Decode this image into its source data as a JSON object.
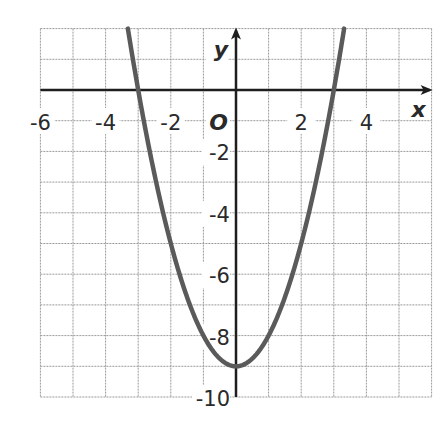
{
  "chart_data": {
    "type": "line",
    "title": "",
    "function": "y = x^2 - 9",
    "xlabel": "x",
    "ylabel": "y",
    "origin_label": "O",
    "xlim": [
      -6,
      6
    ],
    "ylim": [
      -10,
      2
    ],
    "grid": true,
    "grid_step": 1,
    "x_tick_labels": [
      "-6",
      "-4",
      "-2",
      "2",
      "4"
    ],
    "x_ticks": [
      -6,
      -4,
      -2,
      2,
      4
    ],
    "y_tick_labels": [
      "-2",
      "-4",
      "-6",
      "-8",
      "-10"
    ],
    "y_ticks": [
      -2,
      -4,
      -6,
      -8,
      -10
    ],
    "series": [
      {
        "name": "parabola",
        "x": [
          -3.32,
          -3,
          -2,
          -1,
          0,
          1,
          2,
          3,
          3.32
        ],
        "values": [
          2,
          0,
          -5,
          -8,
          -9,
          -8,
          -5,
          0,
          2
        ]
      }
    ],
    "key_points": {
      "vertex": [
        0,
        -9
      ],
      "x_intercepts": [
        [
          -3,
          0
        ],
        [
          3,
          0
        ]
      ]
    },
    "colors": {
      "curve": "#5a5a5a",
      "axis": "#1e1e1e",
      "grid": "#9a9a9a"
    }
  }
}
